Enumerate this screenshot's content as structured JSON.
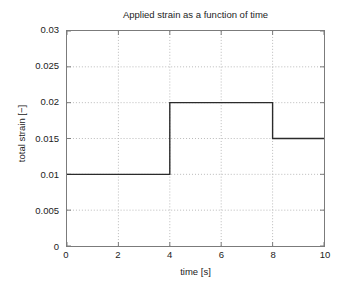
{
  "chart_data": {
    "type": "line",
    "title": "Applied strain as a function of time",
    "xlabel": "time [s]",
    "ylabel": "total strain [−]",
    "xlim": [
      0,
      10
    ],
    "ylim": [
      0,
      0.03
    ],
    "grid": true,
    "legend": null,
    "xticks": [
      "0",
      "2",
      "4",
      "6",
      "8",
      "10"
    ],
    "xtick_values": [
      0,
      2,
      4,
      6,
      8,
      10
    ],
    "yticks": [
      "0",
      "0.005",
      "0.01",
      "0.015",
      "0.02",
      "0.025",
      "0.03"
    ],
    "ytick_values": [
      0,
      0.005,
      0.01,
      0.015,
      0.02,
      0.025,
      0.03
    ],
    "line_color": "#2b2b2b",
    "grid_color": "#b9b9b9",
    "axis_color": "#7b7b7b",
    "series": [
      {
        "name": "total strain",
        "style": "step",
        "x": [
          0,
          4,
          4,
          8,
          8,
          10
        ],
        "y": [
          0.01,
          0.01,
          0.02,
          0.02,
          0.015,
          0.015
        ]
      }
    ],
    "steps": [
      {
        "t_start": 0,
        "t_end": 4,
        "strain": 0.01
      },
      {
        "t_start": 4,
        "t_end": 8,
        "strain": 0.02
      },
      {
        "t_start": 8,
        "t_end": 10,
        "strain": 0.015
      }
    ]
  }
}
